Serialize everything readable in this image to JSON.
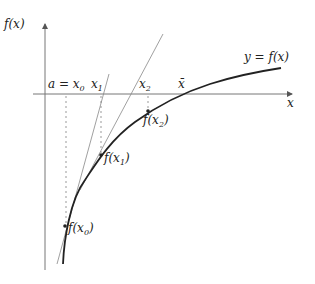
{
  "diagram": {
    "labels": {
      "y_axis": "f(x)",
      "x_axis": "x",
      "curve": "y = f(x)",
      "x0": "a = x",
      "x0_sub": "0",
      "x1": "x",
      "x1_sub": "1",
      "x2": "x",
      "x2_sub": "2",
      "xbar": "x̄",
      "fx0": "f(x",
      "fx0_sub": "0",
      "fx0_end": ")",
      "fx1": "f(x",
      "fx1_sub": "1",
      "fx1_end": ")",
      "fx2": "f(x",
      "fx2_sub": "2",
      "fx2_end": ")"
    },
    "colors": {
      "axis": "#666666",
      "curve": "#222222",
      "tangent": "#777777",
      "dashed": "#999999"
    }
  }
}
